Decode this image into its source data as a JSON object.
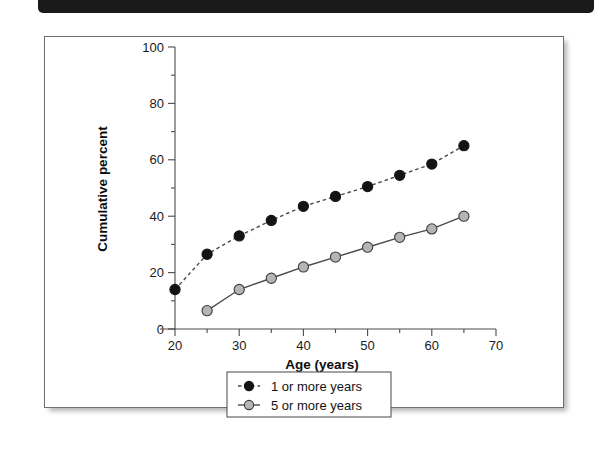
{
  "figure": {
    "header_bar_color": "#1a1a1a",
    "frame_border_color": "#6e6e6e",
    "background_color": "#ffffff"
  },
  "chart_data": {
    "type": "line",
    "title": "",
    "xlabel": "Age (years)",
    "ylabel": "Cumulative percent",
    "xlim": [
      15,
      70
    ],
    "ylim": [
      0,
      100
    ],
    "xticks": [
      20,
      30,
      40,
      50,
      60,
      70
    ],
    "xtick_labels": [
      "20",
      "30",
      "40",
      "50",
      "60",
      "70"
    ],
    "xminor_ticks": [
      25,
      35,
      45,
      55,
      65
    ],
    "yticks": [
      0,
      20,
      40,
      60,
      80,
      100
    ],
    "ytick_labels": [
      "0",
      "20",
      "40",
      "60",
      "80",
      "100"
    ],
    "yminor_ticks": [
      10,
      30,
      50,
      70,
      90
    ],
    "grid": false,
    "legend_position": "below-axes-center",
    "series": [
      {
        "name": "1 or more years",
        "marker": "filled-circle",
        "marker_color": "#141414",
        "marker_edge_color": "#141414",
        "line_style": "dashed",
        "line_color": "#4a4a4a",
        "x": [
          20,
          25,
          30,
          35,
          40,
          45,
          50,
          55,
          60,
          65
        ],
        "values": [
          14,
          26.5,
          33,
          38.5,
          43.5,
          47,
          50.5,
          54.5,
          58.5,
          65
        ]
      },
      {
        "name": "5 or more years",
        "marker": "filled-circle",
        "marker_color": "#b5b5b5",
        "marker_edge_color": "#3d3d3d",
        "line_style": "solid",
        "line_color": "#4a4a4a",
        "x": [
          25,
          30,
          35,
          40,
          45,
          50,
          55,
          60,
          65
        ],
        "values": [
          6.5,
          14,
          18,
          22,
          25.5,
          29,
          32.5,
          35.5,
          40
        ]
      }
    ]
  },
  "legend": {
    "entries": [
      {
        "label": "1 or more years"
      },
      {
        "label": "5 or more years"
      }
    ]
  }
}
